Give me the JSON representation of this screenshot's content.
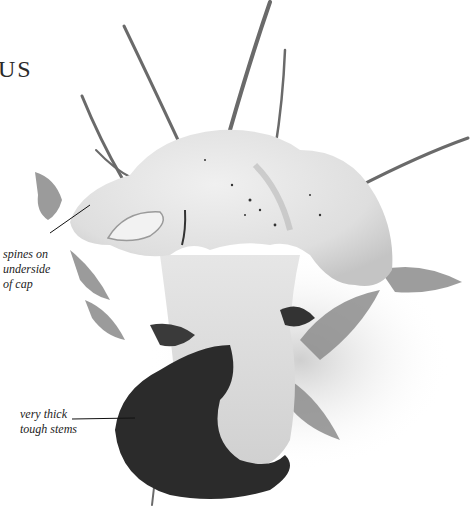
{
  "title_fragment": "US",
  "annotations": [
    {
      "id": "spines",
      "lines": [
        "spines on",
        "underside",
        "of cap"
      ]
    },
    {
      "id": "stems",
      "lines": [
        "very thick",
        "tough stems"
      ]
    }
  ],
  "illustration": {
    "subject": "mushroom-photograph",
    "style": "grayscale",
    "colors": {
      "background": "#ffffff",
      "cap": "#e4e4e4",
      "cap_shade": "#c8c8c8",
      "soil": "#2a2a2a",
      "foliage": "#7a7a7a",
      "grass": "#6a6a6a"
    }
  }
}
